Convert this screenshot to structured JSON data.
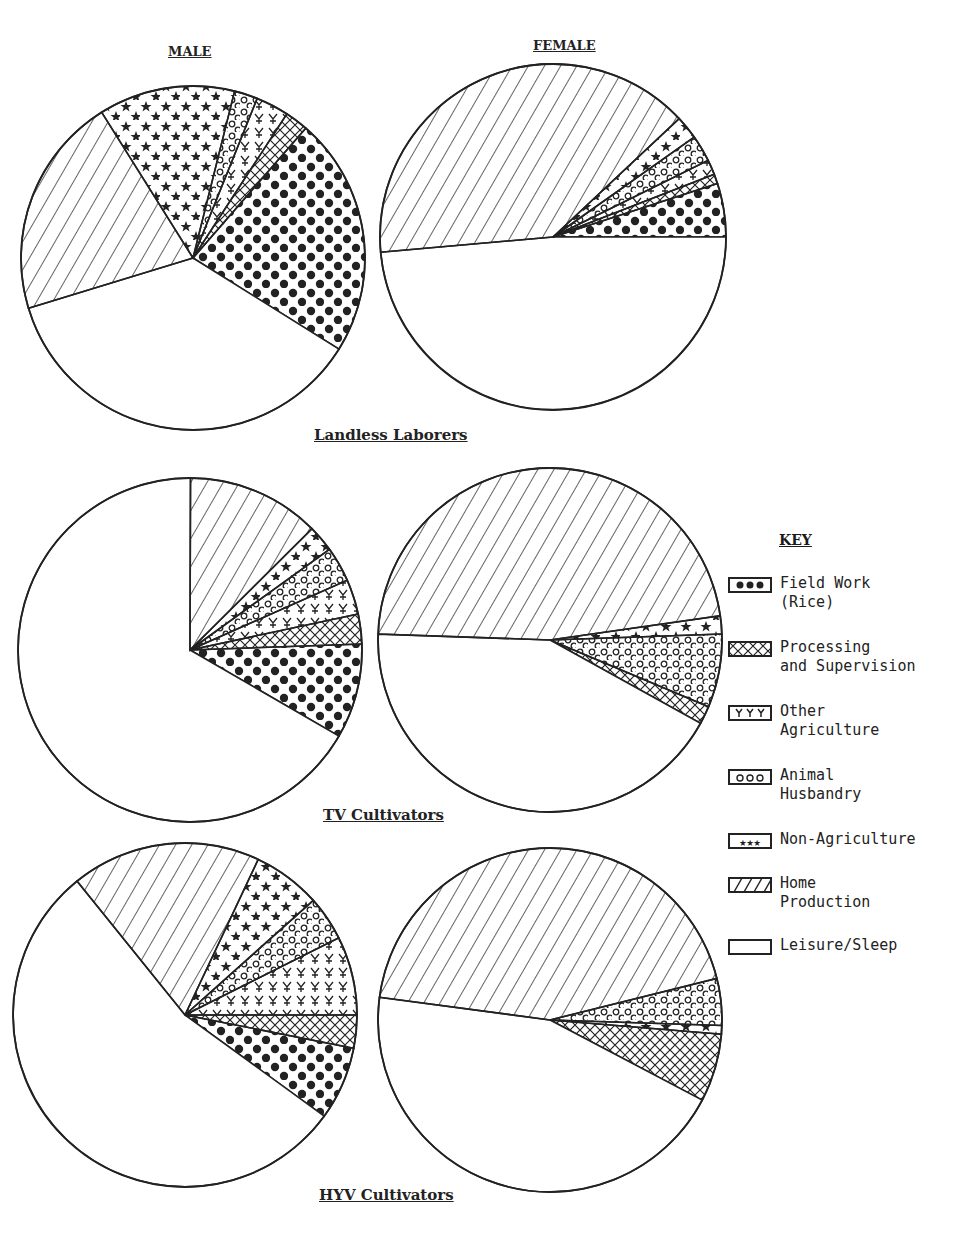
{
  "labels": {
    "male": "MALE",
    "female": "FEMALE",
    "group1": "Landless Laborers",
    "group2": "TV Cultivators",
    "group3": "HYV Cultivators",
    "key_title": "KEY"
  },
  "key": [
    {
      "id": "field",
      "label": "Field Work\n(Rice)",
      "pattern": "dots-filled"
    },
    {
      "id": "processing",
      "label": "Processing\nand Supervision",
      "pattern": "crosshatch"
    },
    {
      "id": "otherag",
      "label": "Other\nAgriculture",
      "pattern": "crosses"
    },
    {
      "id": "animal",
      "label": "Animal\nHusbandry",
      "pattern": "circles"
    },
    {
      "id": "nonag",
      "label": "Non-Agriculture",
      "pattern": "stars"
    },
    {
      "id": "home",
      "label": "Home\nProduction",
      "pattern": "diagonal-lines"
    },
    {
      "id": "leisure",
      "label": "Leisure/Sleep",
      "pattern": "blank"
    }
  ],
  "chart_data": {
    "type": "pie",
    "legend_position": "right",
    "categories": [
      "Field Work (Rice)",
      "Processing and Supervision",
      "Other Agriculture",
      "Animal Husbandry",
      "Non-Agriculture",
      "Home Production",
      "Leisure/Sleep"
    ],
    "pies": [
      {
        "group": "Landless Laborers",
        "sex": "MALE",
        "cx": 193,
        "cy": 258,
        "r": 172,
        "start_deg": 41,
        "slices": [
          {
            "cat": "Field Work (Rice)",
            "value": 22.5
          },
          {
            "cat": "Leisure/Sleep",
            "value": 36.4
          },
          {
            "cat": "Home Production",
            "value": 20.8
          },
          {
            "cat": "Non-Agriculture",
            "value": 12.8
          },
          {
            "cat": "Animal Husbandry",
            "value": 2.2
          },
          {
            "cat": "Other Agriculture",
            "value": 3.1
          },
          {
            "cat": "Processing and Supervision",
            "value": 2.2
          }
        ]
      },
      {
        "group": "Landless Laborers",
        "sex": "FEMALE",
        "cx": 553,
        "cy": 237,
        "r": 173,
        "start_deg": 72,
        "slices": [
          {
            "cat": "Field Work (Rice)",
            "value": 5.0
          },
          {
            "cat": "Leisure/Sleep",
            "value": 48.6
          },
          {
            "cat": "Home Production",
            "value": 39.4
          },
          {
            "cat": "Non-Agriculture",
            "value": 2.2
          },
          {
            "cat": "Animal Husbandry",
            "value": 2.5
          },
          {
            "cat": "Other Agriculture",
            "value": 1.4
          },
          {
            "cat": "Processing and Supervision",
            "value": 0.9
          }
        ]
      },
      {
        "group": "TV Cultivators",
        "sex": "MALE",
        "cx": 190,
        "cy": 650,
        "r": 172,
        "start_deg": 88,
        "slices": [
          {
            "cat": "Field Work (Rice)",
            "value": 8.9
          },
          {
            "cat": "Leisure/Sleep",
            "value": 66.7
          },
          {
            "cat": "Home Production",
            "value": 12.5
          },
          {
            "cat": "Non-Agriculture",
            "value": 2.5
          },
          {
            "cat": "Animal Husbandry",
            "value": 3.3
          },
          {
            "cat": "Other Agriculture",
            "value": 3.3
          },
          {
            "cat": "Processing and Supervision",
            "value": 2.8
          }
        ]
      },
      {
        "group": "TV Cultivators",
        "sex": "FEMALE",
        "cx": 550,
        "cy": 640,
        "r": 172,
        "start_deg": 88,
        "slices": [
          {
            "cat": "Animal Husbandry",
            "value": 6.9
          },
          {
            "cat": "Processing and Supervision",
            "value": 1.7
          },
          {
            "cat": "Leisure/Sleep",
            "value": 42.5
          },
          {
            "cat": "Home Production",
            "value": 47.2
          },
          {
            "cat": "Non-Agriculture",
            "value": 1.7
          }
        ]
      },
      {
        "group": "HYV Cultivators",
        "sex": "MALE",
        "cx": 185,
        "cy": 1015,
        "r": 172,
        "start_deg": 90,
        "slices": [
          {
            "cat": "Processing and Supervision",
            "value": 3.1
          },
          {
            "cat": "Field Work (Rice)",
            "value": 6.9
          },
          {
            "cat": "Leisure/Sleep",
            "value": 54.2
          },
          {
            "cat": "Home Production",
            "value": 17.8
          },
          {
            "cat": "Non-Agriculture",
            "value": 6.4
          },
          {
            "cat": "Animal Husbandry",
            "value": 4.2
          },
          {
            "cat": "Other Agriculture",
            "value": 7.4
          }
        ]
      },
      {
        "group": "HYV Cultivators",
        "sex": "FEMALE",
        "cx": 550,
        "cy": 1020,
        "r": 172,
        "start_deg": 76,
        "slices": [
          {
            "cat": "Animal Husbandry",
            "value": 4.4
          },
          {
            "cat": "Non-Agriculture",
            "value": 0.8
          },
          {
            "cat": "Processing and Supervision",
            "value": 6.4
          },
          {
            "cat": "Leisure/Sleep",
            "value": 44.4
          },
          {
            "cat": "Home Production",
            "value": 44.0
          }
        ]
      }
    ],
    "note": "Values estimated from slice angles; percentages of total time."
  }
}
